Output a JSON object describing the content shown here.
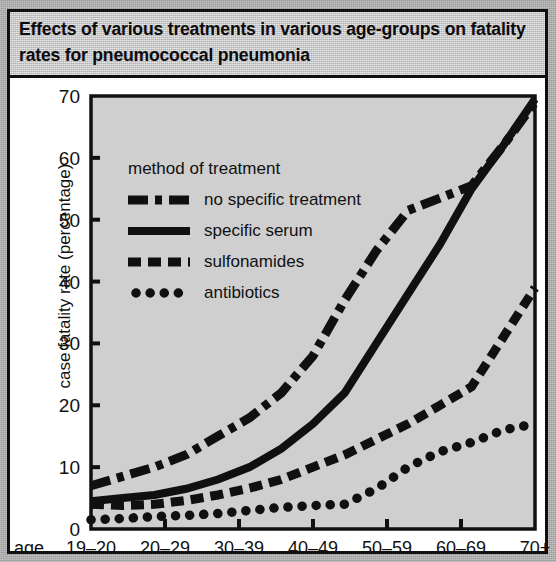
{
  "title": "Effects of various treatments in various age-groups on fatality rates for pneumococcal pneumonia",
  "axis": {
    "ylabel": "case fatality rate (percentage)",
    "age_prefix": "age"
  },
  "legend": {
    "title": "method of treatment",
    "entries": [
      {
        "label": "no specific treatment",
        "style": "dash-dot"
      },
      {
        "label": "specific serum",
        "style": "solid"
      },
      {
        "label": "sulfonamides",
        "style": "dashed"
      },
      {
        "label": "antibiotics",
        "style": "dotted"
      }
    ]
  },
  "colors": {
    "ink": "#101010",
    "plot_fill": "#cfcfcf",
    "title_fill": "#c9c9c9",
    "page_bg": "#adadad",
    "card_bg": "#ffffff"
  },
  "chart_data": {
    "type": "line",
    "title": "Effects of various treatments in various age-groups on fatality rates for pneumococcal pneumonia",
    "xlabel": "age",
    "ylabel": "case fatality rate (percentage)",
    "categories": [
      "19–20",
      "20–29",
      "30–39",
      "40–49",
      "50–59",
      "60–69",
      "70+"
    ],
    "yticks": [
      0,
      10,
      20,
      30,
      40,
      50,
      60,
      70
    ],
    "ylim": [
      0,
      70
    ],
    "grid": false,
    "legend_position": "upper-left-inside",
    "series": [
      {
        "name": "no specific treatment",
        "style": "dash-dot",
        "values": [
          7,
          10,
          15,
          22,
          37,
          51.5,
          69
        ],
        "detail": [
          7,
          8.5,
          10,
          12,
          15,
          18,
          22,
          28,
          37,
          45,
          51.5,
          53.5,
          55.5,
          62,
          69
        ]
      },
      {
        "name": "specific serum",
        "style": "solid",
        "values": [
          4.5,
          5.5,
          8,
          13,
          22,
          38,
          69.5
        ],
        "detail": [
          4.5,
          5,
          5.5,
          6.5,
          8,
          10,
          13,
          17,
          22,
          30,
          38,
          46,
          55,
          62,
          69.5
        ]
      },
      {
        "name": "sulfonamides",
        "style": "dashed",
        "values": [
          4,
          4,
          5.5,
          8,
          12,
          23,
          39
        ],
        "detail": [
          4,
          3.8,
          4,
          4.6,
          5.5,
          6.6,
          8,
          10,
          12,
          14.5,
          17,
          20,
          23,
          31,
          39
        ]
      },
      {
        "name": "antibiotics",
        "style": "dotted",
        "values": [
          1.5,
          2,
          2.5,
          3.5,
          4,
          10,
          17
        ],
        "detail": [
          1.5,
          1.7,
          2,
          2.2,
          2.5,
          3,
          3.5,
          3.8,
          4,
          6.5,
          10,
          12.5,
          14,
          16,
          17
        ]
      }
    ]
  }
}
